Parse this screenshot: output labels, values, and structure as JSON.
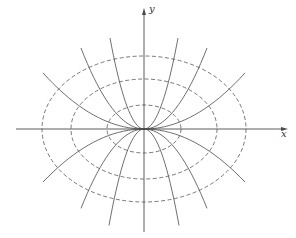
{
  "diagram": {
    "title": "",
    "origin_px": [
      144,
      129
    ],
    "colors": {
      "background": "#ffffff",
      "stroke": "#4a4a4a",
      "dashed": "#555555",
      "label": "#333333"
    },
    "axes": {
      "x": {
        "label": "x",
        "from_px": 16,
        "to_px": 288
      },
      "y": {
        "label": "y",
        "from_px": 232,
        "to_px": 8
      }
    },
    "ellipses": [
      {
        "name": "inner",
        "style": "dashed",
        "rx": 37,
        "ry": 24
      },
      {
        "name": "middle",
        "style": "dashed",
        "rx": 73,
        "ry": 50
      },
      {
        "name": "outer",
        "style": "dashed",
        "rx": 102,
        "ry": 73
      }
    ],
    "curves": {
      "description": "solid parabolas y = k·x^2 through origin, tangent to x-axis, orthogonal to the ellipses",
      "upper": [
        {
          "k": 0.0787,
          "x_extent": 34
        },
        {
          "k": 0.0204,
          "x_extent": 63
        },
        {
          "k": 0.0055,
          "x_extent": 101
        }
      ],
      "lower": [
        {
          "k": -0.0787,
          "x_extent": 35
        },
        {
          "k": -0.02,
          "x_extent": 63
        },
        {
          "k": -0.0052,
          "x_extent": 101
        }
      ]
    }
  }
}
